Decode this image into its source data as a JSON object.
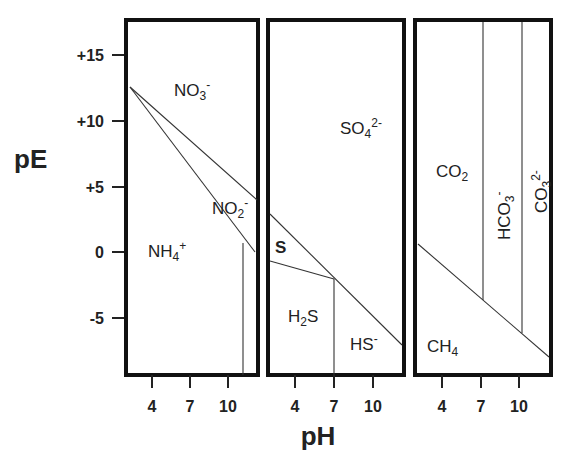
{
  "figure": {
    "y_axis_title": "pE",
    "x_axis_title": "pH",
    "y_ticks": [
      {
        "label": "+15",
        "value": 15
      },
      {
        "label": "+10",
        "value": 10
      },
      {
        "label": "+5",
        "value": 5
      },
      {
        "label": "0",
        "value": 0
      },
      {
        "label": "-5",
        "value": -5
      }
    ],
    "x_ticks": [
      "4",
      "7",
      "10"
    ],
    "panels": [
      {
        "name": "nitrogen",
        "species": [
          {
            "base": "NO",
            "sub": "3",
            "sup": "-"
          },
          {
            "base": "NO",
            "sub": "2",
            "sup": "-"
          },
          {
            "base": "NH",
            "sub": "4",
            "sup": "+"
          }
        ]
      },
      {
        "name": "sulfur",
        "species": [
          {
            "base": "SO",
            "sub": "4",
            "sup": "2-"
          },
          {
            "base": "S",
            "sub": "",
            "sup": ""
          },
          {
            "base": "H",
            "sub": "2",
            "post": "S"
          },
          {
            "base": "HS",
            "sub": "",
            "sup": "-"
          }
        ]
      },
      {
        "name": "carbon",
        "species": [
          {
            "base": "CO",
            "sub": "2",
            "sup": ""
          },
          {
            "base": "HCO",
            "sub": "3",
            "sup": "-"
          },
          {
            "base": "CO",
            "sub": "3",
            "sup": "2-"
          },
          {
            "base": "CH",
            "sub": "4",
            "sup": ""
          }
        ]
      }
    ]
  }
}
